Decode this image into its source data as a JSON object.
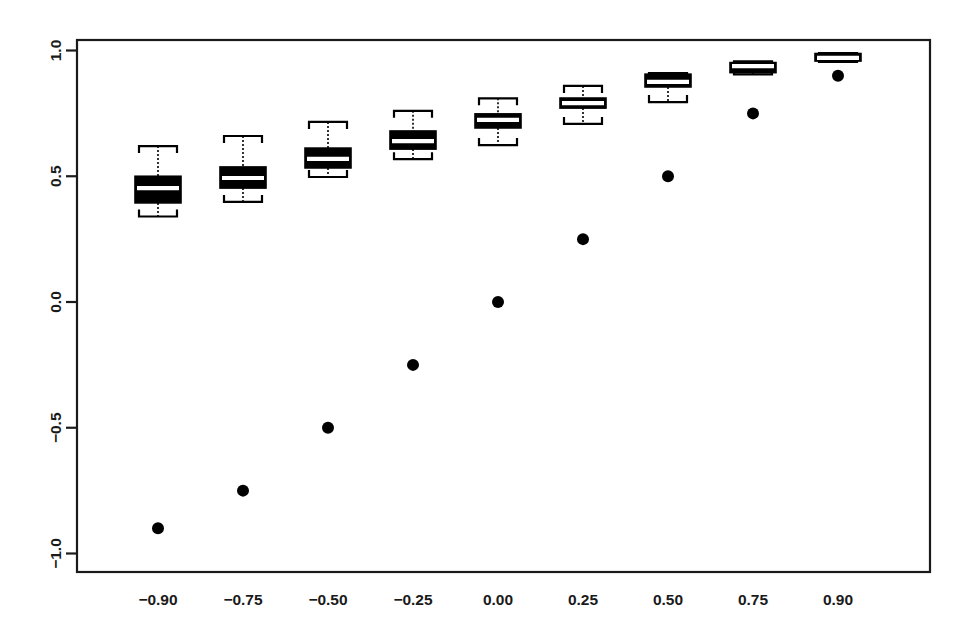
{
  "chart_data": {
    "type": "box",
    "title": "",
    "subtitle": "",
    "xlabel": "",
    "ylabel": "",
    "xlim": [
      -1,
      1
    ],
    "ylim": [
      -1.1,
      1.1
    ],
    "grid": false,
    "legend": "none",
    "box_fill": "#000000",
    "box_line": "#000000",
    "median_color": "#ffffff",
    "point_color": "#000000",
    "axis_color": "#1a1a1a",
    "background": "#ffffff",
    "categories": [
      "-0.90",
      "-0.75",
      "-0.50",
      "-0.25",
      "0.00",
      "0.25",
      "0.50",
      "0.75",
      "0.90"
    ],
    "x_tick_labels": [
      "−0.90",
      "−0.75",
      "−0.50",
      "−0.25",
      "0.00",
      "0.25",
      "0.50",
      "0.75",
      "0.90"
    ],
    "y_tick_values": [
      1.0,
      0.5,
      0.0,
      -0.5,
      -1.0
    ],
    "y_tick_labels": [
      "1.0",
      "0.5",
      "0.0",
      "−0.5",
      "−1.0"
    ],
    "boxes": [
      {
        "category": "-0.90",
        "whisker_low": 0.34,
        "q1": 0.394,
        "median": 0.453,
        "q3": 0.5,
        "whisker_high": 0.62
      },
      {
        "category": "-0.75",
        "whisker_low": 0.398,
        "q1": 0.453,
        "median": 0.493,
        "q3": 0.537,
        "whisker_high": 0.66
      },
      {
        "category": "-0.50",
        "whisker_low": 0.497,
        "q1": 0.533,
        "median": 0.569,
        "q3": 0.612,
        "whisker_high": 0.716
      },
      {
        "category": "-0.25",
        "whisker_low": 0.568,
        "q1": 0.608,
        "median": 0.64,
        "q3": 0.68,
        "whisker_high": 0.76
      },
      {
        "category": "0.00",
        "whisker_low": 0.624,
        "q1": 0.692,
        "median": 0.724,
        "q3": 0.748,
        "whisker_high": 0.81
      },
      {
        "category": "0.25",
        "whisker_low": 0.708,
        "q1": 0.771,
        "median": 0.791,
        "q3": 0.811,
        "whisker_high": 0.859
      },
      {
        "category": "0.50",
        "whisker_low": 0.795,
        "q1": 0.855,
        "median": 0.875,
        "q3": 0.906,
        "whisker_high": 0.91
      },
      {
        "category": "0.75",
        "whisker_low": 0.905,
        "q1": 0.912,
        "median": 0.938,
        "q3": 0.952,
        "whisker_high": 0.957
      },
      {
        "category": "0.90",
        "whisker_low": 0.955,
        "q1": 0.958,
        "median": 0.971,
        "q3": 0.988,
        "whisker_high": 0.99
      }
    ],
    "reference_points": [
      {
        "category": "-0.90",
        "value": -0.9
      },
      {
        "category": "-0.75",
        "value": -0.75
      },
      {
        "category": "-0.50",
        "value": -0.5
      },
      {
        "category": "-0.25",
        "value": -0.25
      },
      {
        "category": "0.00",
        "value": 0.0
      },
      {
        "category": "0.25",
        "value": 0.25
      },
      {
        "category": "0.50",
        "value": 0.5
      },
      {
        "category": "0.75",
        "value": 0.75
      },
      {
        "category": "0.90",
        "value": 0.9
      }
    ]
  },
  "figure": {
    "plot_left_px": 77,
    "plot_right_px": 930,
    "plot_top_px": 40,
    "plot_bottom_px": 572,
    "y_zero_px": 302,
    "y_unit_px": 251.5,
    "x_positions_px": [
      158,
      243,
      328,
      413,
      498,
      583,
      668,
      753,
      838
    ],
    "box_half_width_px": 23,
    "cap_half_width_px": 19,
    "point_radius_px": 6
  }
}
